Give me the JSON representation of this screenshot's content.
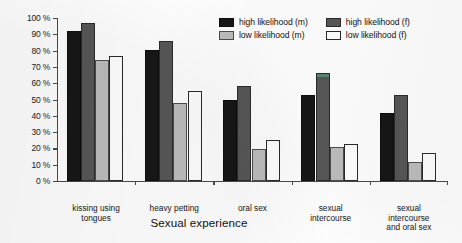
{
  "chart_data": {
    "type": "bar",
    "title": "",
    "xlabel": "Sexual experience",
    "ylabel": "",
    "ylim": [
      0,
      100
    ],
    "grid": false,
    "legend_position": "top-right",
    "categories": [
      "kissing using tongues",
      "heavy petting",
      "oral sex",
      "sexual intercourse",
      "sexual intercourse and oral sex"
    ],
    "category_lines": [
      [
        "kissing using",
        "tongues"
      ],
      [
        "heavy petting"
      ],
      [
        "oral sex"
      ],
      [
        "sexual",
        "intercourse"
      ],
      [
        "sexual",
        "intercourse",
        "and oral sex"
      ]
    ],
    "ytick_labels": [
      "0 %",
      "10 %",
      "20 %",
      "30 %",
      "40 %",
      "50 %",
      "60 %",
      "70 %",
      "80 %",
      "90 %",
      "100 %"
    ],
    "ytick_values": [
      0,
      10,
      20,
      30,
      40,
      50,
      60,
      70,
      80,
      90,
      100
    ],
    "series": [
      {
        "name": "high likelihood (m)",
        "color": "#171717",
        "values": [
          92,
          80.5,
          50,
          52.5,
          42
        ]
      },
      {
        "name": "high likelihood (f)",
        "color": "#575757",
        "values": [
          97,
          86,
          58,
          66,
          53
        ]
      },
      {
        "name": "low likelihood (m)",
        "color": "#bdbdbd",
        "values": [
          74.5,
          48,
          19.5,
          21,
          11.5
        ]
      },
      {
        "name": "low likelihood (f)",
        "color": "#ffffff",
        "values": [
          76.5,
          55,
          25,
          23,
          17
        ]
      }
    ],
    "legend_order": [
      "high likelihood (m)",
      "high likelihood (f)",
      "low likelihood (m)",
      "low likelihood (f)"
    ]
  }
}
